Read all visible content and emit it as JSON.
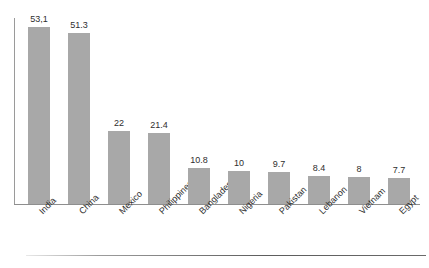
{
  "chart_data": {
    "type": "bar",
    "title": "",
    "subtitle": "",
    "xlabel": "",
    "ylabel": "",
    "categories": [
      "India",
      "China",
      "Mexico",
      "Philippines",
      "Bangladesh",
      "Nigeria",
      "Pakistan",
      "Lebanon",
      "Vietnam",
      "Egypt"
    ],
    "values": [
      53.1,
      51.3,
      22,
      21.4,
      10.8,
      10,
      9.7,
      8.4,
      8,
      7.7
    ],
    "value_labels": [
      "53,1",
      "51.3",
      "22",
      "21.4",
      "10.8",
      "10",
      "9.7",
      "8.4",
      "8",
      "7.7"
    ],
    "ylim": [
      0,
      56
    ],
    "grid": false,
    "legend": null,
    "annotations": [],
    "series": [
      {
        "name": "",
        "values": [
          53.1,
          51.3,
          22,
          21.4,
          10.8,
          10,
          9.7,
          8.4,
          8,
          7.7
        ]
      }
    ]
  },
  "style": {
    "bar_color": "#a8a8a8",
    "axis_color": "#8e8e8e",
    "text_color": "#2e2e2e",
    "background": "#ffffff"
  }
}
